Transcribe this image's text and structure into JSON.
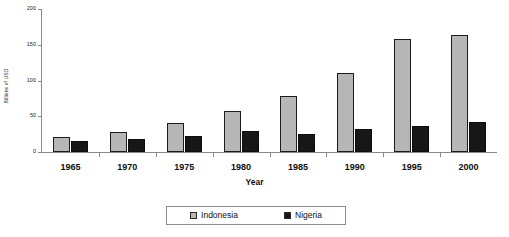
{
  "chart_data": {
    "type": "bar",
    "title": "",
    "subtitle": "",
    "xlabel": "Year",
    "ylabel": "Billions of USD",
    "categories": [
      "1965",
      "1970",
      "1975",
      "1980",
      "1985",
      "1990",
      "1995",
      "2000"
    ],
    "series": [
      {
        "name": "Indonesia",
        "color": "#b6b6b6",
        "values": [
          21,
          28,
          40,
          58,
          78,
          110,
          158,
          163
        ]
      },
      {
        "name": "Nigeria",
        "color": "#171717",
        "values": [
          15,
          18,
          22,
          29,
          25,
          32,
          36,
          42
        ]
      }
    ],
    "ylim": [
      0,
      200
    ],
    "yticks": [
      "0",
      "50",
      "100",
      "150",
      "200"
    ],
    "ytick_values": [
      0,
      50,
      100,
      150,
      200
    ],
    "grid": false,
    "legend_position": "bottom-center",
    "axis_color": "#8a8a8a",
    "bar_border_color": "#1c1c1c"
  },
  "legend": {
    "entries": [
      {
        "label": "Indonesia",
        "swatch": "legend-swatch-indonesia"
      },
      {
        "label": "Nigeria",
        "swatch": "legend-swatch-nigeria"
      }
    ]
  }
}
